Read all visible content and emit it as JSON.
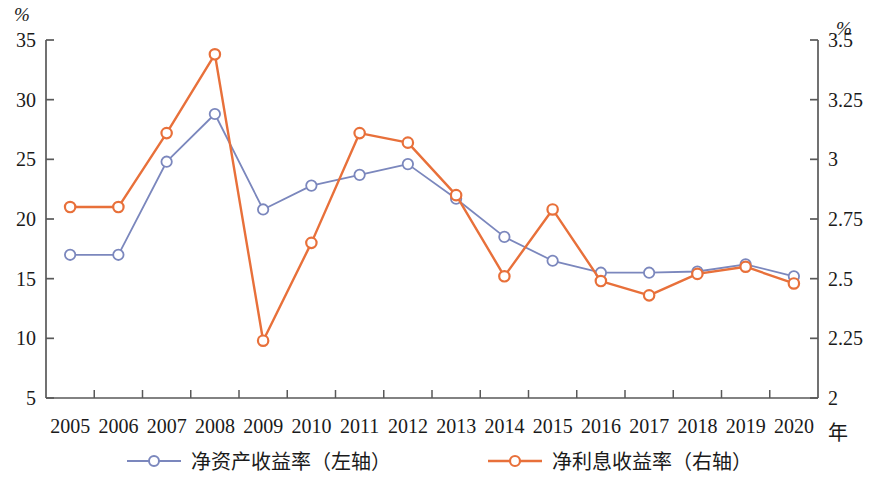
{
  "chart_data": {
    "type": "line",
    "title": "",
    "xlabel": "年",
    "categories": [
      "2005",
      "2006",
      "2007",
      "2008",
      "2009",
      "2010",
      "2011",
      "2012",
      "2013",
      "2014",
      "2015",
      "2016",
      "2017",
      "2018",
      "2019",
      "2020"
    ],
    "left_axis": {
      "unit": "%",
      "ylabel": "%",
      "ylim": [
        5,
        35
      ],
      "ticks": [
        "5",
        "10",
        "15",
        "20",
        "25",
        "30",
        "35"
      ],
      "tick_values": [
        5,
        10,
        15,
        20,
        25,
        30,
        35
      ]
    },
    "right_axis": {
      "unit": "%",
      "ylabel": "%",
      "ylim": [
        2,
        3.5
      ],
      "ticks": [
        "2",
        "2.25",
        "2.5",
        "2.75",
        "3",
        "3.25",
        "3.5"
      ],
      "tick_values": [
        2,
        2.25,
        2.5,
        2.75,
        3,
        3.25,
        3.5
      ]
    },
    "grid": false,
    "legend_position": "bottom-center",
    "series": [
      {
        "name": "净资产收益率（左轴）",
        "axis": "left",
        "color": "#7b87bd",
        "marker": "open-circle",
        "values": [
          17.0,
          17.0,
          24.8,
          28.8,
          20.8,
          22.8,
          23.7,
          24.6,
          21.7,
          18.5,
          16.5,
          15.5,
          15.5,
          15.6,
          16.2,
          15.2
        ]
      },
      {
        "name": "净利息收益率（右轴）",
        "axis": "right",
        "color": "#e8703a",
        "marker": "open-circle",
        "values": [
          2.8,
          2.8,
          3.11,
          3.44,
          2.24,
          2.65,
          3.11,
          3.07,
          2.85,
          2.51,
          2.79,
          2.49,
          2.43,
          2.52,
          2.55,
          2.48
        ]
      }
    ]
  },
  "legend": {
    "items": [
      {
        "label": "净资产收益率（左轴）",
        "color": "#7b87bd"
      },
      {
        "label": "净利息收益率（右轴）",
        "color": "#e8703a"
      }
    ]
  }
}
